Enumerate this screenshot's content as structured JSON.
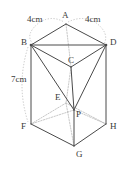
{
  "figure": {
    "stroke_color": "#4a4a4a",
    "hidden_stroke_color": "#b0b0b0",
    "text_color": "#3a3a3a",
    "background": "#ffffff",
    "vertex_labels": [
      {
        "id": "A",
        "text": "A",
        "x": 62,
        "y": 11
      },
      {
        "id": "B",
        "text": "B",
        "x": 21,
        "y": 38
      },
      {
        "id": "C",
        "text": "C",
        "x": 68,
        "y": 56
      },
      {
        "id": "D",
        "text": "D",
        "x": 110,
        "y": 38
      },
      {
        "id": "E",
        "text": "E",
        "x": 55,
        "y": 93
      },
      {
        "id": "F",
        "text": "F",
        "x": 21,
        "y": 122
      },
      {
        "id": "G",
        "text": "G",
        "x": 76,
        "y": 150
      },
      {
        "id": "H",
        "text": "H",
        "x": 110,
        "y": 122
      },
      {
        "id": "P",
        "text": "P",
        "x": 76,
        "y": 110
      }
    ],
    "measurement_labels": [
      {
        "id": "ab-length",
        "text": "4cm",
        "x": 27,
        "y": 15
      },
      {
        "id": "ad-length",
        "text": "4cm",
        "x": 85,
        "y": 15
      },
      {
        "id": "bf-length",
        "text": "7cm",
        "x": 11,
        "y": 75
      }
    ],
    "points": {
      "A": {
        "x": 66,
        "y": 24
      },
      "B": {
        "x": 31,
        "y": 45
      },
      "C": {
        "x": 71,
        "y": 67
      },
      "D": {
        "x": 106,
        "y": 45
      },
      "E": {
        "x": 66,
        "y": 103
      },
      "F": {
        "x": 31,
        "y": 124
      },
      "G": {
        "x": 74,
        "y": 146
      },
      "H": {
        "x": 106,
        "y": 124
      },
      "P": {
        "x": 74,
        "y": 110
      }
    },
    "solid_edges": [
      {
        "id": "edge-A-B",
        "from": "A",
        "to": "B"
      },
      {
        "id": "edge-A-D",
        "from": "A",
        "to": "D"
      },
      {
        "id": "edge-B-D",
        "from": "B",
        "to": "D"
      },
      {
        "id": "edge-B-C",
        "from": "B",
        "to": "C"
      },
      {
        "id": "edge-C-D",
        "from": "C",
        "to": "D"
      },
      {
        "id": "edge-B-P",
        "from": "B",
        "to": "P"
      },
      {
        "id": "edge-D-P",
        "from": "D",
        "to": "P"
      },
      {
        "id": "edge-C-P",
        "from": "C",
        "to": "P"
      },
      {
        "id": "edge-B-F",
        "from": "B",
        "to": "F"
      },
      {
        "id": "edge-D-H",
        "from": "D",
        "to": "H"
      },
      {
        "id": "edge-F-G",
        "from": "F",
        "to": "G"
      },
      {
        "id": "edge-G-H",
        "from": "G",
        "to": "H"
      },
      {
        "id": "edge-P-G",
        "from": "P",
        "to": "G"
      }
    ],
    "hidden_edges": [
      {
        "id": "edge-A-C-hidden",
        "from": "A",
        "to": "C"
      },
      {
        "id": "edge-C-E-hidden",
        "from": "C",
        "to": "E"
      },
      {
        "id": "edge-E-F-hidden",
        "from": "E",
        "to": "F"
      },
      {
        "id": "edge-E-H-hidden",
        "from": "E",
        "to": "H"
      },
      {
        "id": "edge-E-G-hidden",
        "from": "E",
        "to": "G"
      },
      {
        "id": "edge-P-F-hidden",
        "from": "P",
        "to": "F"
      },
      {
        "id": "edge-P-H-hidden",
        "from": "P",
        "to": "H"
      }
    ],
    "dotted_arcs": [
      {
        "id": "arc-ab-measure",
        "d": "M 33 44 Q 24 34 40 22 Q 52 15 64 22"
      },
      {
        "id": "arc-ad-measure",
        "d": "M 68 22 Q 82 15 95 22 Q 110 33 104 44"
      },
      {
        "id": "arc-bf-measure",
        "d": "M 28 47 Q 16 85 28 122"
      }
    ]
  }
}
